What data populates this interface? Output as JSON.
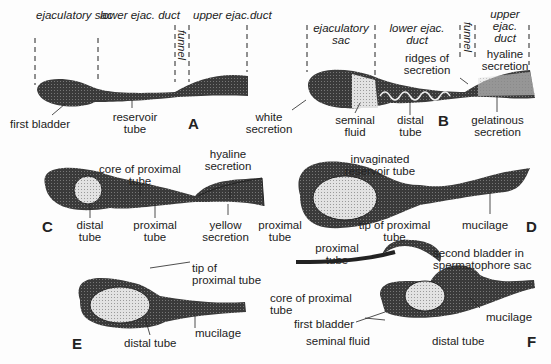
{
  "figure": {
    "panels": {
      "A": {
        "letter": "A",
        "regions": [
          "ejaculatory\nsac",
          "lower ejac.\nduct",
          "funnel",
          "upper\nejac.duct"
        ],
        "region_ejac_sac": "ejaculatory sac",
        "region_lower": "lower ejac. duct",
        "region_funnel": "funnel",
        "region_upper": "upper ejac.duct",
        "labels": {
          "first_bladder": "first bladder",
          "reservoir_tube": "reservoir tube",
          "white_secretion": "white secretion"
        }
      },
      "B": {
        "letter": "B",
        "region_ejac_sac": "ejaculatory sac",
        "region_lower": "lower ejac. duct",
        "region_funnel": "funnel",
        "region_upper": "upper ejac. duct",
        "labels": {
          "ridges": "ridges of secretion",
          "hyaline": "hyaline secretion",
          "seminal_fluid": "seminal fluid",
          "distal_tube": "distal tube",
          "gelatinous": "gelatinous secretion"
        }
      },
      "C": {
        "letter": "C",
        "labels": {
          "core": "core of proximal tube",
          "hyaline": "hyaline secretion",
          "distal_tube": "distal tube",
          "proximal_tube": "proximal tube",
          "yellow": "yellow secretion"
        }
      },
      "D": {
        "letter": "D",
        "labels": {
          "invaginated": "invaginated reservoir tube",
          "proximal_tube": "proximal tube",
          "tip": "tip of proximal tube",
          "mucilage": "mucilage"
        }
      },
      "E": {
        "letter": "E",
        "labels": {
          "tip": "tip of proximal tube",
          "mucilage": "mucilage",
          "distal_tube": "distal tube"
        }
      },
      "F": {
        "letter": "F",
        "labels": {
          "proximal_tube": "proximal tube",
          "second_bladder": "second bladder in spermatophore sac",
          "core": "core of proximal tube",
          "first_bladder": "first bladder",
          "seminal_fluid": "seminal fluid",
          "distal_tube": "distal tube",
          "mucilage": "mucilage"
        }
      }
    },
    "colors": {
      "dark": "#3a3a3a",
      "light": "#d8d8d8",
      "line": "#222222"
    }
  }
}
